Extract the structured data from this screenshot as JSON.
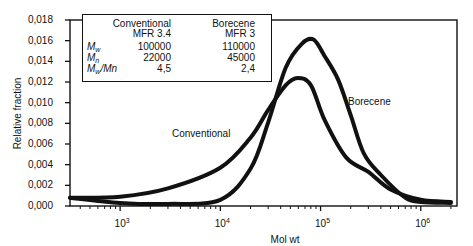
{
  "chart_data": {
    "type": "line",
    "title": "",
    "xlabel": "Mol wt",
    "ylabel": "Relative fraction",
    "xscale": "log",
    "xlim": [
      316,
      2300000
    ],
    "ylim": [
      0,
      0.018
    ],
    "grid": false,
    "y_ticks": [
      "0,000",
      "0,002",
      "0,004",
      "0,006",
      "0,008",
      "0,010",
      "0,012",
      "0,014",
      "0,016",
      "0,018"
    ],
    "x_ticks": [
      {
        "base": "10",
        "exp": "3",
        "value": 1000
      },
      {
        "base": "10",
        "exp": "4",
        "value": 10000
      },
      {
        "base": "10",
        "exp": "5",
        "value": 100000
      },
      {
        "base": "10",
        "exp": "6",
        "value": 1000000
      }
    ],
    "series": [
      {
        "name": "Conventional",
        "x": [
          316,
          1000,
          3000,
          10000,
          20000,
          30000,
          45000,
          59000,
          80000,
          110000,
          180000,
          300000,
          500000,
          1000000,
          2000000
        ],
        "y": [
          0.0008,
          0.0009,
          0.0017,
          0.0037,
          0.0066,
          0.0093,
          0.0117,
          0.0124,
          0.0117,
          0.0083,
          0.0047,
          0.0033,
          0.0016,
          0.0006,
          0.0004
        ]
      },
      {
        "name": "Borecene",
        "x": [
          316,
          1000,
          3000,
          10000,
          20000,
          30000,
          45000,
          65000,
          85000,
          110000,
          150000,
          200000,
          270000,
          400000,
          700000,
          1000000,
          2000000
        ],
        "y": [
          0.0008,
          0.0003,
          0.0002,
          0.0006,
          0.0036,
          0.0081,
          0.0134,
          0.0157,
          0.0161,
          0.0145,
          0.0122,
          0.0088,
          0.0051,
          0.003,
          0.0008,
          0.0004,
          0.0003
        ]
      }
    ],
    "legend": {
      "position": "upper-left-inset",
      "headers": [
        "",
        "Conventional",
        "Borecene"
      ],
      "subheaders": [
        "",
        "MFR 3.4",
        "MFR 3"
      ],
      "rows": [
        {
          "label_main": "M",
          "label_sub": "w",
          "label_tail": "",
          "conventional": "100000",
          "borecene": "110000"
        },
        {
          "label_main": "M",
          "label_sub": "n",
          "label_tail": "",
          "conventional": "22000",
          "borecene": "45000"
        },
        {
          "label_main": "M",
          "label_sub": "w",
          "label_tail": "/Mn",
          "conventional": "4,5",
          "borecene": "2,4"
        }
      ]
    },
    "annotations": [
      {
        "text": "Conventional",
        "near_series": "Conventional"
      },
      {
        "text": "Borecene",
        "near_series": "Borecene"
      }
    ]
  },
  "colors": {
    "line": "#111111",
    "background": "#ffffff"
  }
}
